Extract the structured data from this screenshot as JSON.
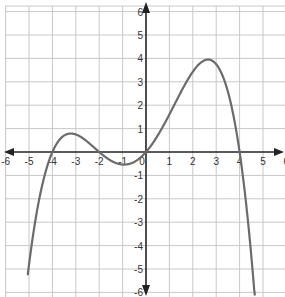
{
  "chart_data": {
    "type": "line",
    "title": "",
    "xlabel": "",
    "ylabel": "",
    "xlim": [
      -6,
      6
    ],
    "ylim": [
      -6,
      6
    ],
    "grid": true,
    "x_ticks": [
      -6,
      -5,
      -4,
      -3,
      -2,
      -1,
      0,
      1,
      2,
      3,
      4,
      5,
      6
    ],
    "y_ticks": [
      -6,
      -5,
      -4,
      -3,
      -2,
      -1,
      1,
      2,
      3,
      4,
      5,
      6
    ],
    "x_tick_labels": [
      "-6",
      "-5",
      "-4",
      "-3",
      "-2",
      "-1",
      "0",
      "1",
      "2",
      "3",
      "4",
      "5",
      "6"
    ],
    "y_tick_labels": [
      "-6",
      "-5",
      "-4",
      "-3",
      "-2",
      "-1",
      "1",
      "2",
      "3",
      "4",
      "5",
      "6"
    ],
    "series": [
      {
        "name": "polynomial",
        "description": "Quartic with roots at -4, -2, 0, 4; local max near (-3.2, 0.8), local min near (-1, -0.5), local max near (2.7, 4)",
        "roots": [
          -4,
          -2,
          0,
          4
        ],
        "x": [
          -5.05,
          -4.5,
          -4,
          -3.5,
          -3.2,
          -3,
          -2.5,
          -2,
          -1.5,
          -1,
          -0.5,
          0,
          0.5,
          1,
          1.5,
          2,
          2.5,
          2.7,
          3,
          3.5,
          4,
          4.4,
          4.65
        ],
        "y": [
          -6.0,
          -2.1,
          0,
          0.7,
          0.79,
          0.75,
          0.46,
          0,
          -0.38,
          -0.54,
          -0.44,
          0,
          0.71,
          1.61,
          2.53,
          3.43,
          3.94,
          3.99,
          3.86,
          2.81,
          0,
          -3.7,
          -6.0
        ]
      }
    ],
    "colors": {
      "curve": "#6b6b6b",
      "axis": "#222222",
      "grid": "#c8c8c8"
    }
  },
  "axes": {
    "x_arrow_left": "arrow-left",
    "x_arrow_right": "arrow-right",
    "y_arrow_up": "arrow-up",
    "y_arrow_down": "arrow-down"
  }
}
